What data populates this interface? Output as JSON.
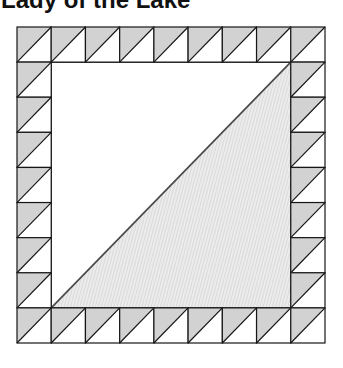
{
  "title": "Lady of the Lake",
  "figure": {
    "type": "quilt-block-diagram",
    "block_name": "Lady of the Lake",
    "units_per_side": 9,
    "border_unit_count": 32,
    "left": 17,
    "top": 27,
    "width": 308,
    "height": 316,
    "border_unit": "half-square triangle, diagonal from bottom-left to top-right, shaded half upper-left, white half lower-right",
    "center_unit": "large square, diagonal from bottom-left to top-right, white upper-left, fine-hatched lower-right",
    "colors": {
      "canvas_bg": "#ffffff",
      "unit_bg": "#ffffff",
      "triangle": "#d2d2d2",
      "hatch_base": "#ececec",
      "hatch_line": "#d9d9d9",
      "outline": "#161616",
      "diagonal": "#4a4a4a",
      "title_color": "#111111"
    }
  }
}
